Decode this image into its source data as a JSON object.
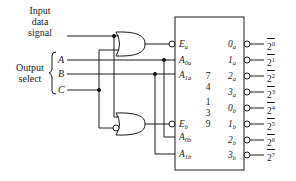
{
  "labels": {
    "input_line1": "Input",
    "input_line2": "data",
    "input_line3": "signal",
    "select_line1": "Output",
    "select_line2": "select"
  },
  "select_inputs": [
    "A",
    "B",
    "C"
  ],
  "chip": {
    "number_digits": [
      "7",
      "4",
      "1",
      "3",
      "9"
    ],
    "left_pins_a": [
      {
        "main": "E",
        "sub": "a"
      },
      {
        "main": "A",
        "sub": "0a"
      },
      {
        "main": "A",
        "sub": "1a"
      }
    ],
    "left_pins_b": [
      {
        "main": "E",
        "sub": "b"
      },
      {
        "main": "A",
        "sub": "0b"
      },
      {
        "main": "A",
        "sub": "1b"
      }
    ],
    "right_pins": [
      {
        "main": "0",
        "sub": "a"
      },
      {
        "main": "1",
        "sub": "a"
      },
      {
        "main": "2",
        "sub": "a"
      },
      {
        "main": "3",
        "sub": "a"
      },
      {
        "main": "0",
        "sub": "b"
      },
      {
        "main": "1",
        "sub": "b"
      },
      {
        "main": "2",
        "sub": "b"
      },
      {
        "main": "3",
        "sub": "b"
      }
    ]
  },
  "outputs": [
    {
      "base": "2",
      "exp": "0"
    },
    {
      "base": "2",
      "exp": "1"
    },
    {
      "base": "2",
      "exp": "2"
    },
    {
      "base": "2",
      "exp": "3"
    },
    {
      "base": "2",
      "exp": "4"
    },
    {
      "base": "2",
      "exp": "5"
    },
    {
      "base": "2",
      "exp": "6"
    },
    {
      "base": "2",
      "exp": "7"
    }
  ],
  "gates": [
    {
      "type": "OR",
      "position": "top",
      "inverted_input": false
    },
    {
      "type": "OR",
      "position": "bottom",
      "inverted_input": true
    }
  ],
  "colors": {
    "line": "#1a1a1a",
    "background": "#ffffff"
  }
}
